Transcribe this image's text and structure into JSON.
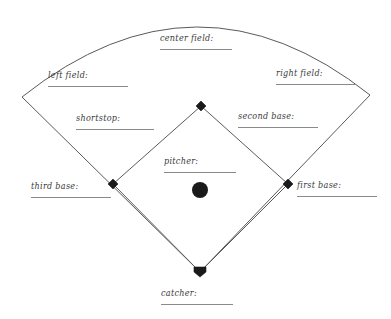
{
  "worksheet": {
    "type": "baseball-field-position-labeling",
    "colors": {
      "line": "#555555",
      "rule": "#8a8a8a",
      "marker": "#1a1a1a",
      "text": "#3a3a3a",
      "background": "#ffffff"
    },
    "labels": [
      {
        "id": "center-field",
        "text": "center field:",
        "x": 160,
        "y": 33,
        "rule_width": 72,
        "align": "left"
      },
      {
        "id": "left-field",
        "text": "left field:",
        "x": 48,
        "y": 70,
        "rule_width": 80,
        "align": "left"
      },
      {
        "id": "right-field",
        "text": "right field:",
        "x": 276,
        "y": 68,
        "rule_width": 80,
        "align": "left"
      },
      {
        "id": "shortstop",
        "text": "shortstop:",
        "x": 76,
        "y": 113,
        "rule_width": 78,
        "align": "left"
      },
      {
        "id": "second-base",
        "text": "second base:",
        "x": 238,
        "y": 111,
        "rule_width": 80,
        "align": "left"
      },
      {
        "id": "pitcher",
        "text": "pitcher:",
        "x": 164,
        "y": 156,
        "rule_width": 72,
        "align": "left"
      },
      {
        "id": "third-base",
        "text": "third base:",
        "x": 31,
        "y": 181,
        "rule_width": 80,
        "align": "left"
      },
      {
        "id": "first-base",
        "text": "first base:",
        "x": 297,
        "y": 180,
        "rule_width": 80,
        "align": "left"
      },
      {
        "id": "catcher",
        "text": "catcher:",
        "x": 161,
        "y": 288,
        "rule_width": 72,
        "align": "left"
      }
    ],
    "field_geometry": {
      "home_plate": {
        "x": 200,
        "y": 272
      },
      "first_base": {
        "x": 288,
        "y": 184
      },
      "second_base": {
        "x": 201,
        "y": 106
      },
      "third_base": {
        "x": 113,
        "y": 184
      },
      "pitchers_mound": {
        "x": 200,
        "y": 190,
        "radius": 8
      },
      "left_foul_corner": {
        "x": 22,
        "y": 97
      },
      "right_foul_corner": {
        "x": 370,
        "y": 95
      },
      "outfield_arc_apex": {
        "x": 197,
        "y": 15
      },
      "base_marker_size": 6
    }
  }
}
